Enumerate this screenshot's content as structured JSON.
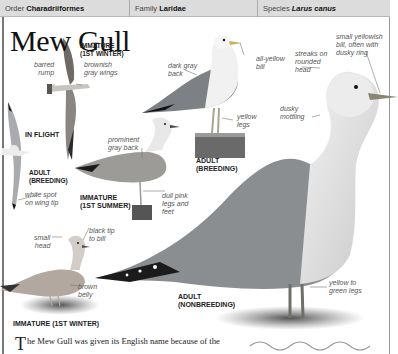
{
  "header": {
    "order_label": "Order",
    "order_value": "Charadriiformes",
    "family_label": "Family",
    "family_value": "Laridae",
    "species_label": "Species",
    "species_value": "Larus canus"
  },
  "title": "Mew Gull",
  "illustrations": {
    "in_flight": {
      "heading": "IN FLIGHT",
      "immature_label_1": "IMMATURE",
      "immature_label_2": "(1ST WINTER)",
      "barred_rump_1": "barred",
      "barred_rump_2": "rump",
      "brownish_wings_1": "brownish",
      "brownish_wings_2": "gray wings",
      "adult_label_1": "ADULT",
      "adult_label_2": "(BREEDING)",
      "white_spot_1": "white spot",
      "white_spot_2": "on wing tip"
    },
    "adult_breeding": {
      "label_1": "ADULT",
      "label_2": "(BREEDING)",
      "dark_gray_back_1": "dark gray",
      "dark_gray_back_2": "back",
      "all_yellow_bill_1": "all-yellow",
      "all_yellow_bill_2": "bill",
      "yellow_legs_1": "yellow",
      "yellow_legs_2": "legs"
    },
    "immature_1st_summer": {
      "label_1": "IMMATURE",
      "label_2": "(1ST SUMMER)",
      "prominent_back_1": "prominent",
      "prominent_back_2": "gray back",
      "dull_pink_1": "dull pink",
      "dull_pink_2": "legs and",
      "dull_pink_3": "feet"
    },
    "immature_1st_winter": {
      "label": "IMMATURE (1ST WINTER)",
      "small_head_1": "small",
      "small_head_2": "head",
      "black_tip_1": "black tip",
      "black_tip_2": "to bill",
      "brown_belly_1": "brown",
      "brown_belly_2": "belly"
    },
    "adult_nonbreeding": {
      "label_1": "ADULT",
      "label_2": "(NONBREEDING)",
      "streaks_1": "streaks on",
      "streaks_2": "rounded",
      "streaks_3": "head",
      "small_bill_1": "small yellowish",
      "small_bill_2": "bill, often with",
      "small_bill_3": "dusky ring",
      "dusky_1": "dusky",
      "dusky_2": "mottling",
      "legs_1": "yellow to",
      "legs_2": "green legs"
    }
  },
  "body_text": {
    "drop_cap": "T",
    "line_1": "he Mew Gull was given its English name because of the"
  },
  "colors": {
    "header_bg": "#dcdcdc",
    "gull_mantle": "#8a8d90",
    "wingtip_black": "#1c1c1c",
    "leg_color": "#9a9a8a"
  }
}
